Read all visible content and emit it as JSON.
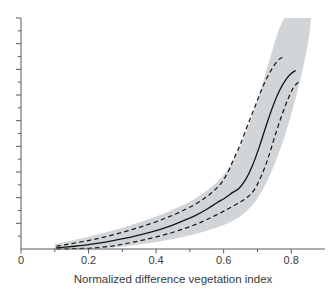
{
  "chart_data": {
    "type": "line",
    "title": "",
    "subtitle": "",
    "xlabel": "Normalized difference vegetation index",
    "ylabel": "",
    "xlim": [
      0,
      0.9
    ],
    "ylim": [
      0,
      1
    ],
    "grid": false,
    "legend": null,
    "legend_position": "none",
    "xticks": [
      0,
      0.2,
      0.4,
      0.6,
      0.8
    ],
    "xtick_labels": [
      "0",
      "0.2",
      "0.4",
      "0.6",
      "0.8"
    ],
    "xminor_ticks": [
      0.1,
      0.3,
      0.5,
      0.7
    ],
    "yticks": [],
    "ytick_labels": [],
    "yminor_count": 18,
    "band_color": "#d2d5d7",
    "line_color": "#1a1a1a",
    "axis_color": "#5a5a5a",
    "series": [
      {
        "name": "median",
        "style": "solid",
        "x": [
          0.105,
          0.13,
          0.16,
          0.19,
          0.22,
          0.25,
          0.28,
          0.31,
          0.34,
          0.37,
          0.4,
          0.43,
          0.46,
          0.49,
          0.52,
          0.55,
          0.58,
          0.605,
          0.625,
          0.645,
          0.665,
          0.685,
          0.705,
          0.725,
          0.745,
          0.765,
          0.785,
          0.8,
          0.812
        ],
        "y": [
          0.005,
          0.008,
          0.012,
          0.017,
          0.023,
          0.03,
          0.038,
          0.047,
          0.057,
          0.068,
          0.08,
          0.094,
          0.11,
          0.128,
          0.148,
          0.172,
          0.2,
          0.222,
          0.243,
          0.262,
          0.3,
          0.36,
          0.44,
          0.53,
          0.615,
          0.685,
          0.735,
          0.76,
          0.772
        ]
      },
      {
        "name": "upper-bound",
        "style": "dashed",
        "x": [
          0.105,
          0.13,
          0.16,
          0.19,
          0.22,
          0.25,
          0.28,
          0.31,
          0.34,
          0.37,
          0.4,
          0.43,
          0.46,
          0.49,
          0.52,
          0.545,
          0.565,
          0.585,
          0.6,
          0.615,
          0.63,
          0.65,
          0.672,
          0.695,
          0.715,
          0.735,
          0.752,
          0.765,
          0.775
        ],
        "y": [
          0.012,
          0.018,
          0.026,
          0.034,
          0.043,
          0.053,
          0.064,
          0.076,
          0.089,
          0.103,
          0.118,
          0.135,
          0.153,
          0.174,
          0.197,
          0.222,
          0.245,
          0.272,
          0.3,
          0.34,
          0.39,
          0.455,
          0.54,
          0.625,
          0.7,
          0.76,
          0.8,
          0.822,
          0.83
        ]
      },
      {
        "name": "lower-bound",
        "style": "dashed",
        "x": [
          0.105,
          0.14,
          0.17,
          0.2,
          0.23,
          0.26,
          0.29,
          0.32,
          0.35,
          0.38,
          0.41,
          0.44,
          0.47,
          0.5,
          0.53,
          0.56,
          0.59,
          0.615,
          0.64,
          0.665,
          0.69,
          0.712,
          0.733,
          0.752,
          0.772,
          0.79,
          0.805,
          0.818,
          0.828
        ],
        "y": [
          0.0,
          0.001,
          0.002,
          0.003,
          0.006,
          0.011,
          0.018,
          0.026,
          0.035,
          0.045,
          0.056,
          0.068,
          0.082,
          0.097,
          0.114,
          0.134,
          0.156,
          0.175,
          0.196,
          0.218,
          0.255,
          0.318,
          0.4,
          0.49,
          0.578,
          0.648,
          0.695,
          0.718,
          0.728
        ]
      }
    ],
    "band": {
      "name": "confidence-band",
      "upper_x": [
        0.1,
        0.14,
        0.18,
        0.22,
        0.26,
        0.3,
        0.34,
        0.38,
        0.42,
        0.46,
        0.5,
        0.53,
        0.56,
        0.585,
        0.605,
        0.622,
        0.638,
        0.655,
        0.672,
        0.69,
        0.708,
        0.724,
        0.738,
        0.75,
        0.76,
        0.768,
        0.774,
        0.778,
        0.78
      ],
      "upper_y": [
        0.022,
        0.034,
        0.047,
        0.061,
        0.076,
        0.092,
        0.11,
        0.13,
        0.152,
        0.177,
        0.205,
        0.232,
        0.264,
        0.298,
        0.33,
        0.368,
        0.412,
        0.465,
        0.528,
        0.6,
        0.68,
        0.76,
        0.83,
        0.89,
        0.935,
        0.965,
        0.985,
        0.995,
        1.0
      ],
      "lower_x": [
        0.1,
        0.15,
        0.2,
        0.25,
        0.3,
        0.35,
        0.4,
        0.45,
        0.5,
        0.55,
        0.59,
        0.625,
        0.655,
        0.685,
        0.712,
        0.738,
        0.762,
        0.785,
        0.805,
        0.822,
        0.836,
        0.846,
        0.853,
        0.857,
        0.859
      ],
      "lower_y": [
        0.0,
        0.0,
        0.001,
        0.004,
        0.01,
        0.019,
        0.03,
        0.043,
        0.059,
        0.079,
        0.098,
        0.12,
        0.148,
        0.19,
        0.248,
        0.322,
        0.41,
        0.508,
        0.61,
        0.705,
        0.79,
        0.862,
        0.92,
        0.968,
        1.0
      ]
    }
  },
  "axis": {
    "xlabel": "Normalized difference vegetation index",
    "tick_0": "0",
    "tick_1": "0.2",
    "tick_2": "0.4",
    "tick_3": "0.6",
    "tick_4": "0.8"
  }
}
